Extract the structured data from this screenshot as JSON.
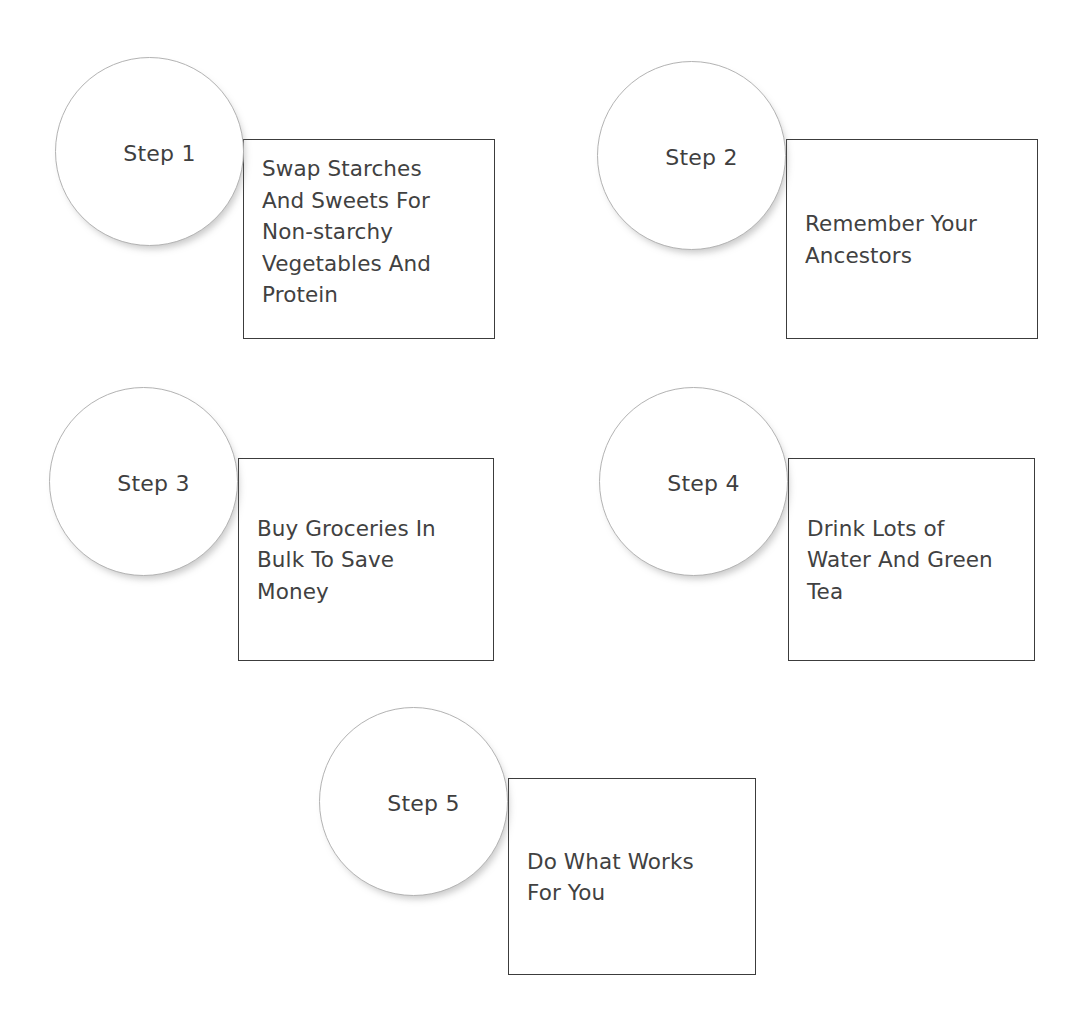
{
  "diagram": {
    "type": "step-process",
    "step_count": 5,
    "colors": {
      "background": "#ffffff",
      "circle_stroke": "#b3b3b3",
      "circle_fill": "#ffffff",
      "box_stroke": "#3c3c3c",
      "box_fill": "#ffffff",
      "text": "#414141"
    },
    "steps": [
      {
        "label": "Step 1",
        "text": "Swap Starches And Sweets For Non-starchy Vegetables And Protein",
        "lines": "Swap Starches\nAnd Sweets For\nNon-starchy\nVegetables And\nProtein",
        "text_align": "top",
        "circle": {
          "x": 55,
          "y": 57,
          "size": 189
        },
        "box": {
          "x": 243,
          "y": 139,
          "w": 252,
          "h": 200
        }
      },
      {
        "label": "Step 2",
        "text": "Remember Your Ancestors",
        "lines": "Remember Your\nAncestors",
        "text_align": "middle",
        "circle": {
          "x": 597,
          "y": 61,
          "size": 189
        },
        "box": {
          "x": 786,
          "y": 139,
          "w": 252,
          "h": 200
        }
      },
      {
        "label": "Step 3",
        "text": "Buy Groceries In Bulk To Save Money",
        "lines": "Buy Groceries In\nBulk To Save\nMoney",
        "text_align": "middle",
        "circle": {
          "x": 49,
          "y": 387,
          "size": 189
        },
        "box": {
          "x": 238,
          "y": 458,
          "w": 256,
          "h": 203
        }
      },
      {
        "label": "Step 4",
        "text": "Drink Lots of Water And Green Tea",
        "lines": "Drink Lots of\nWater And Green\nTea",
        "text_align": "middle",
        "circle": {
          "x": 599,
          "y": 387,
          "size": 189
        },
        "box": {
          "x": 788,
          "y": 458,
          "w": 247,
          "h": 203
        }
      },
      {
        "label": "Step 5",
        "text": "Do What Works For You",
        "lines": "Do What Works\nFor You",
        "text_align": "middle",
        "circle": {
          "x": 319,
          "y": 707,
          "size": 189
        },
        "box": {
          "x": 508,
          "y": 778,
          "w": 248,
          "h": 197
        }
      }
    ]
  }
}
